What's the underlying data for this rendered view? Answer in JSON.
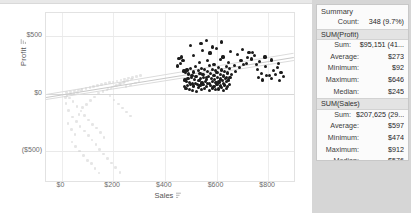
{
  "chart_data": {
    "type": "scatter",
    "title": "",
    "xlabel": "Sales",
    "ylabel": "Profit",
    "xlim": [
      -60,
      900
    ],
    "ylim": [
      -760,
      700
    ],
    "xticks": [
      "$0",
      "$200",
      "$400",
      "$600",
      "$800"
    ],
    "xtick_values": [
      0,
      200,
      400,
      600,
      800
    ],
    "yticks": [
      "$500",
      "$0",
      "($500)"
    ],
    "ytick_values": [
      500,
      0,
      -500
    ],
    "grid": true,
    "legend": "none",
    "series": [
      {
        "name": "Selected marks",
        "color": "#1b1b1b",
        "count": 348,
        "points": [
          [
            474,
            196
          ],
          [
            480,
            180
          ],
          [
            486,
            205
          ],
          [
            492,
            170
          ],
          [
            498,
            215
          ],
          [
            505,
            160
          ],
          [
            512,
            188
          ],
          [
            518,
            233
          ],
          [
            524,
            150
          ],
          [
            530,
            198
          ],
          [
            536,
            176
          ],
          [
            542,
            220
          ],
          [
            548,
            165
          ],
          [
            554,
            206
          ],
          [
            560,
            142
          ],
          [
            566,
            190
          ],
          [
            572,
            243
          ],
          [
            578,
            172
          ],
          [
            584,
            212
          ],
          [
            590,
            158
          ],
          [
            596,
            200
          ],
          [
            602,
            185
          ],
          [
            608,
            228
          ],
          [
            614,
            168
          ],
          [
            620,
            205
          ],
          [
            626,
            152
          ],
          [
            632,
            195
          ],
          [
            638,
            238
          ],
          [
            644,
            178
          ],
          [
            650,
            215
          ],
          [
            478,
            118
          ],
          [
            484,
            105
          ],
          [
            490,
            132
          ],
          [
            496,
            96
          ],
          [
            502,
            140
          ],
          [
            508,
            88
          ],
          [
            514,
            125
          ],
          [
            520,
            148
          ],
          [
            526,
            80
          ],
          [
            532,
            112
          ],
          [
            538,
            128
          ],
          [
            544,
            92
          ],
          [
            550,
            136
          ],
          [
            556,
            104
          ],
          [
            562,
            120
          ],
          [
            568,
            145
          ],
          [
            574,
            85
          ],
          [
            580,
            130
          ],
          [
            586,
            108
          ],
          [
            592,
            122
          ],
          [
            598,
            95
          ],
          [
            604,
            138
          ],
          [
            610,
            100
          ],
          [
            616,
            126
          ],
          [
            622,
            114
          ],
          [
            628,
            90
          ],
          [
            634,
            134
          ],
          [
            640,
            106
          ],
          [
            646,
            118
          ],
          [
            652,
            142
          ],
          [
            476,
            60
          ],
          [
            482,
            45
          ],
          [
            488,
            72
          ],
          [
            494,
            36
          ],
          [
            500,
            80
          ],
          [
            506,
            28
          ],
          [
            512,
            65
          ],
          [
            518,
            88
          ],
          [
            524,
            20
          ],
          [
            530,
            52
          ],
          [
            536,
            68
          ],
          [
            542,
            32
          ],
          [
            548,
            76
          ],
          [
            554,
            44
          ],
          [
            560,
            60
          ],
          [
            566,
            85
          ],
          [
            572,
            25
          ],
          [
            578,
            70
          ],
          [
            584,
            48
          ],
          [
            590,
            62
          ],
          [
            596,
            35
          ],
          [
            602,
            78
          ],
          [
            608,
            40
          ],
          [
            614,
            66
          ],
          [
            620,
            54
          ],
          [
            626,
            30
          ],
          [
            632,
            74
          ],
          [
            638,
            46
          ],
          [
            644,
            58
          ],
          [
            650,
            82
          ],
          [
            510,
            330
          ],
          [
            545,
            375
          ],
          [
            575,
            352
          ],
          [
            600,
            395
          ],
          [
            625,
            318
          ],
          [
            655,
            362
          ],
          [
            680,
            340
          ],
          [
            700,
            380
          ],
          [
            720,
            310
          ],
          [
            740,
            355
          ],
          [
            535,
            268
          ],
          [
            565,
            290
          ],
          [
            590,
            255
          ],
          [
            615,
            298
          ],
          [
            645,
            272
          ],
          [
            670,
            245
          ],
          [
            695,
            285
          ],
          [
            715,
            262
          ],
          [
            735,
            300
          ],
          [
            755,
            250
          ],
          [
            470,
            286
          ],
          [
            462,
            258
          ],
          [
            455,
            302
          ],
          [
            448,
            240
          ],
          [
            466,
            318
          ],
          [
            760,
            210
          ],
          [
            775,
            175
          ],
          [
            790,
            235
          ],
          [
            805,
            160
          ],
          [
            820,
            198
          ],
          [
            835,
            225
          ],
          [
            850,
            182
          ],
          [
            762,
            140
          ],
          [
            778,
            118
          ],
          [
            795,
            155
          ],
          [
            812,
            128
          ],
          [
            828,
            165
          ],
          [
            845,
            110
          ],
          [
            860,
            148
          ],
          [
            840,
            262
          ],
          [
            812,
            292
          ],
          [
            788,
            318
          ],
          [
            768,
            275
          ],
          [
            748,
            330
          ],
          [
            726,
            355
          ],
          [
            705,
            255
          ],
          [
            690,
            225
          ],
          [
            672,
            195
          ],
          [
            658,
            168
          ],
          [
            640,
            140
          ],
          [
            500,
            420
          ],
          [
            560,
            460
          ],
          [
            620,
            448
          ],
          [
            585,
            405
          ],
          [
            540,
            432
          ]
        ]
      },
      {
        "name": "Unselected marks",
        "color": "#cfcfcf",
        "points": [
          [
            20,
            8
          ],
          [
            35,
            14
          ],
          [
            50,
            22
          ],
          [
            65,
            30
          ],
          [
            80,
            38
          ],
          [
            95,
            46
          ],
          [
            110,
            54
          ],
          [
            125,
            62
          ],
          [
            140,
            70
          ],
          [
            155,
            78
          ],
          [
            170,
            86
          ],
          [
            185,
            94
          ],
          [
            200,
            102
          ],
          [
            215,
            110
          ],
          [
            230,
            118
          ],
          [
            245,
            126
          ],
          [
            260,
            134
          ],
          [
            275,
            142
          ],
          [
            290,
            150
          ],
          [
            305,
            158
          ],
          [
            30,
            -40
          ],
          [
            45,
            -70
          ],
          [
            60,
            -110
          ],
          [
            75,
            -150
          ],
          [
            90,
            -190
          ],
          [
            105,
            -230
          ],
          [
            120,
            -270
          ],
          [
            135,
            -300
          ],
          [
            150,
            -340
          ],
          [
            165,
            -380
          ],
          [
            40,
            -420
          ],
          [
            55,
            -460
          ],
          [
            70,
            -500
          ],
          [
            85,
            -540
          ],
          [
            100,
            -580
          ],
          [
            115,
            -610
          ],
          [
            130,
            -650
          ],
          [
            145,
            -690
          ],
          [
            25,
            -260
          ],
          [
            38,
            -310
          ],
          [
            52,
            -355
          ],
          [
            68,
            -180
          ],
          [
            82,
            -120
          ],
          [
            96,
            -95
          ],
          [
            112,
            -60
          ],
          [
            128,
            -30
          ],
          [
            144,
            5
          ],
          [
            160,
            18
          ],
          [
            176,
            32
          ],
          [
            192,
            48
          ],
          [
            208,
            64
          ],
          [
            224,
            80
          ],
          [
            240,
            96
          ],
          [
            256,
            112
          ],
          [
            272,
            128
          ],
          [
            18,
            -85
          ],
          [
            28,
            -145
          ],
          [
            42,
            -205
          ],
          [
            58,
            -245
          ],
          [
            72,
            -285
          ],
          [
            88,
            -325
          ],
          [
            104,
            -365
          ],
          [
            118,
            -405
          ],
          [
            134,
            -445
          ],
          [
            148,
            -485
          ],
          [
            162,
            -525
          ],
          [
            178,
            -565
          ],
          [
            194,
            -605
          ],
          [
            210,
            -645
          ],
          [
            226,
            -685
          ],
          [
            180,
            40
          ],
          [
            196,
            56
          ],
          [
            212,
            72
          ],
          [
            228,
            88
          ],
          [
            244,
            104
          ],
          [
            15,
            -35
          ],
          [
            22,
            -15
          ],
          [
            48,
            2
          ],
          [
            62,
            10
          ],
          [
            78,
            26
          ],
          [
            250,
            60
          ],
          [
            268,
            76
          ],
          [
            286,
            92
          ],
          [
            300,
            108
          ],
          [
            188,
            -20
          ],
          [
            204,
            -55
          ],
          [
            220,
            -90
          ],
          [
            236,
            -125
          ],
          [
            252,
            -160
          ],
          [
            268,
            -195
          ]
        ]
      }
    ],
    "trend_lines": [
      {
        "name": "trend-upper",
        "x0": -60,
        "y0": -8,
        "x1": 900,
        "y1": 352
      },
      {
        "name": "trend-mid",
        "x0": -60,
        "y0": -28,
        "x1": 900,
        "y1": 320
      },
      {
        "name": "trend-lower",
        "x0": -60,
        "y0": -48,
        "x1": 900,
        "y1": 292
      }
    ]
  },
  "axes": {
    "y_title": "Profit",
    "x_title": "Sales"
  },
  "summary": {
    "title": "Summary",
    "count_label": "Count:",
    "count_value": "348 (9.7%)",
    "sections": [
      {
        "header": "SUM(Profit)",
        "rows": [
          {
            "label": "Sum:",
            "value": "$95,151 (41..."
          },
          {
            "label": "Average:",
            "value": "$273"
          },
          {
            "label": "Minimum:",
            "value": "$92"
          },
          {
            "label": "Maximum:",
            "value": "$646"
          },
          {
            "label": "Median:",
            "value": "$245"
          }
        ]
      },
      {
        "header": "SUM(Sales)",
        "rows": [
          {
            "label": "Sum:",
            "value": "$207,625 (29..."
          },
          {
            "label": "Average:",
            "value": "$597"
          },
          {
            "label": "Minimum:",
            "value": "$474"
          },
          {
            "label": "Maximum:",
            "value": "$912"
          },
          {
            "label": "Median:",
            "value": "$576"
          }
        ]
      }
    ]
  },
  "icons": {
    "sort_icon": "sort-icon"
  },
  "colors": {
    "selected_mark": "#1b1b1b",
    "unselected_mark": "#cfcfcf",
    "grid": "#ededed",
    "panel_bg": "#fbfbfb",
    "section_header_bg": "#e3e3e3",
    "gutter": "#d6d6d6"
  }
}
